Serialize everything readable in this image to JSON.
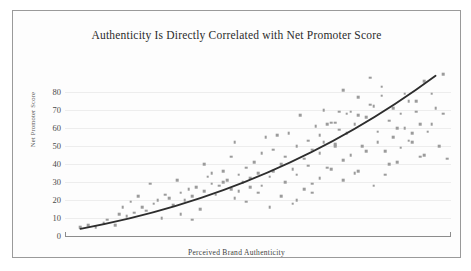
{
  "chart_data": {
    "type": "scatter",
    "title": "Authenticity Is Directly Correlated with Net Promoter Score",
    "xlabel": "Perceived Brand Authenticity",
    "ylabel": "Net Promoter Score",
    "xlim": [
      0,
      100
    ],
    "ylim": [
      0,
      90
    ],
    "grid": true,
    "legend": false,
    "y_ticks": [
      80,
      70,
      60,
      50,
      40,
      30,
      20,
      10,
      0
    ],
    "x_ticks": [],
    "point_color": "#9b9b9b",
    "trend_color": "#2d2d2d",
    "grid_color": "#ededed",
    "frame_color": "#9a9a9a",
    "points": [
      [
        4,
        5
      ],
      [
        6,
        6
      ],
      [
        8,
        5
      ],
      [
        10,
        7
      ],
      [
        11,
        9
      ],
      [
        13,
        6
      ],
      [
        14,
        12
      ],
      [
        15,
        16
      ],
      [
        16,
        11
      ],
      [
        17,
        19
      ],
      [
        18,
        13
      ],
      [
        19,
        22
      ],
      [
        20,
        16
      ],
      [
        21,
        14
      ],
      [
        22,
        29
      ],
      [
        23,
        18
      ],
      [
        24,
        20
      ],
      [
        25,
        10
      ],
      [
        26,
        23
      ],
      [
        27,
        21
      ],
      [
        28,
        17
      ],
      [
        29,
        31
      ],
      [
        30,
        24
      ],
      [
        31,
        20
      ],
      [
        32,
        26
      ],
      [
        33,
        22
      ],
      [
        34,
        27
      ],
      [
        35,
        15
      ],
      [
        36,
        25
      ],
      [
        37,
        33
      ],
      [
        38,
        29
      ],
      [
        39,
        23
      ],
      [
        40,
        28
      ],
      [
        41,
        36
      ],
      [
        42,
        31
      ],
      [
        43,
        26
      ],
      [
        44,
        52
      ],
      [
        45,
        34
      ],
      [
        46,
        30
      ],
      [
        47,
        38
      ],
      [
        48,
        27
      ],
      [
        49,
        41
      ],
      [
        50,
        35
      ],
      [
        51,
        46
      ],
      [
        52,
        55
      ],
      [
        53,
        33
      ],
      [
        54,
        48
      ],
      [
        55,
        56
      ],
      [
        56,
        40
      ],
      [
        57,
        44
      ],
      [
        58,
        57
      ],
      [
        59,
        37
      ],
      [
        60,
        50
      ],
      [
        61,
        67
      ],
      [
        62,
        43
      ],
      [
        63,
        53
      ],
      [
        64,
        29
      ],
      [
        65,
        61
      ],
      [
        66,
        46
      ],
      [
        67,
        70
      ],
      [
        68,
        38
      ],
      [
        69,
        63
      ],
      [
        70,
        51
      ],
      [
        71,
        69
      ],
      [
        72,
        81
      ],
      [
        73,
        57
      ],
      [
        74,
        45
      ],
      [
        75,
        62
      ],
      [
        76,
        77
      ],
      [
        77,
        50
      ],
      [
        78,
        66
      ],
      [
        79,
        88
      ],
      [
        80,
        72
      ],
      [
        81,
        58
      ],
      [
        82,
        83
      ],
      [
        83,
        47
      ],
      [
        84,
        64
      ],
      [
        85,
        55
      ],
      [
        86,
        41
      ],
      [
        87,
        68
      ],
      [
        88,
        60
      ],
      [
        89,
        75
      ],
      [
        90,
        52
      ],
      [
        91,
        69
      ],
      [
        92,
        44
      ],
      [
        93,
        86
      ],
      [
        94,
        58
      ],
      [
        95,
        62
      ],
      [
        96,
        71
      ],
      [
        97,
        50
      ],
      [
        98,
        90
      ],
      [
        99,
        43
      ],
      [
        44,
        21
      ],
      [
        47,
        19
      ],
      [
        50,
        24
      ],
      [
        53,
        16
      ],
      [
        56,
        22
      ],
      [
        59,
        18
      ],
      [
        62,
        26
      ],
      [
        36,
        40
      ],
      [
        38,
        35
      ],
      [
        41,
        30
      ],
      [
        43,
        44
      ],
      [
        45,
        25
      ],
      [
        48,
        32
      ],
      [
        51,
        28
      ],
      [
        54,
        36
      ],
      [
        57,
        30
      ],
      [
        60,
        34
      ],
      [
        63,
        39
      ],
      [
        66,
        32
      ],
      [
        69,
        37
      ],
      [
        72,
        42
      ],
      [
        75,
        35
      ],
      [
        78,
        47
      ],
      [
        81,
        52
      ],
      [
        84,
        40
      ],
      [
        87,
        49
      ],
      [
        90,
        57
      ],
      [
        93,
        45
      ],
      [
        66,
        56
      ],
      [
        68,
        62
      ],
      [
        70,
        63
      ],
      [
        71,
        59
      ],
      [
        73,
        68
      ],
      [
        74,
        69
      ],
      [
        76,
        67
      ],
      [
        79,
        73
      ],
      [
        82,
        78
      ],
      [
        85,
        71
      ],
      [
        88,
        79
      ],
      [
        91,
        75
      ],
      [
        95,
        79
      ],
      [
        98,
        68
      ],
      [
        64,
        48
      ],
      [
        67,
        52
      ],
      [
        70,
        50
      ],
      [
        86,
        60
      ],
      [
        89,
        53
      ],
      [
        92,
        62
      ],
      [
        60,
        20
      ],
      [
        64,
        24
      ],
      [
        72,
        31
      ],
      [
        76,
        36
      ],
      [
        80,
        28
      ],
      [
        83,
        34
      ],
      [
        30,
        12
      ],
      [
        33,
        9
      ]
    ],
    "trend": {
      "shape": "convex-increasing",
      "start": [
        4,
        4
      ],
      "end": [
        96,
        89
      ],
      "control": [
        55,
        24
      ]
    }
  }
}
